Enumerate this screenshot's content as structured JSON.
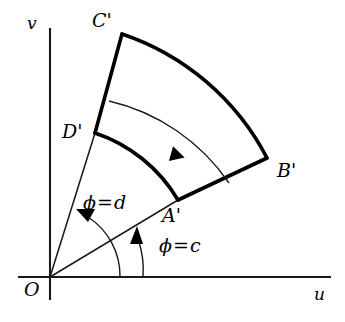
{
  "figure": {
    "type": "geometric-diagram",
    "background_color": "#ffffff",
    "stroke_color": "#000000"
  },
  "axes": {
    "horizontal": {
      "label": "u",
      "y": 277,
      "x_start": 18,
      "x_end": 331
    },
    "vertical": {
      "label": "v",
      "x": 50,
      "y_start": 28,
      "y_end": 300
    },
    "origin": {
      "label": "O",
      "x": 50,
      "y": 277
    }
  },
  "region": {
    "name": "annular-sector",
    "inner_radius": 152,
    "outer_radius": 255,
    "angle_inner_deg": 19,
    "angle_outer_deg": 69,
    "vertices": [
      {
        "label": "A'",
        "role": "inner-arc-start",
        "x": 178,
        "y": 200
      },
      {
        "label": "B'",
        "role": "outer-arc-start",
        "x": 267,
        "y": 158
      },
      {
        "label": "C'",
        "role": "outer-arc-end",
        "x": 122,
        "y": 34
      },
      {
        "label": "D'",
        "role": "inner-arc-end",
        "x": 95,
        "y": 133
      }
    ]
  },
  "angle_markers": [
    {
      "name": "phi-equals-c",
      "text": {
        "phi": "ϕ",
        "operator": "=",
        "value": "c"
      },
      "label_x": 168,
      "label_y": 246,
      "arc_radius": 93,
      "direction": "counterclockwise"
    },
    {
      "name": "phi-equals-d",
      "text": {
        "phi": "ϕ",
        "operator": "=",
        "value": "d"
      },
      "label_x": 90,
      "label_y": 203,
      "arc_radius": 70,
      "direction": "counterclockwise"
    }
  ],
  "orientation_arrow": {
    "name": "region-orientation-arrow",
    "direction": "counterclockwise",
    "radius": 200
  }
}
